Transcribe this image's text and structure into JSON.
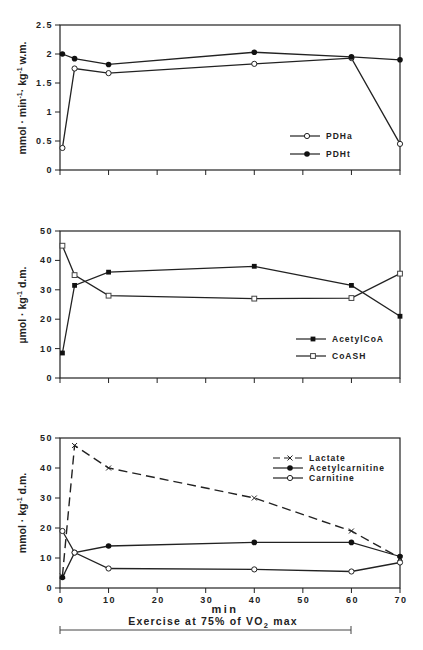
{
  "header": {
    "text": ""
  },
  "chart_data": [
    {
      "type": "line",
      "title": "",
      "xlabel": "",
      "ylabel": "mmol · min⁻¹ · kg⁻¹ w.m.",
      "ylim": [
        0,
        2.5
      ],
      "xlim": [
        0,
        70
      ],
      "yticks": [
        "0",
        "0.5",
        "1",
        "1.5",
        "2",
        "2.5"
      ],
      "legend_position": "lower right",
      "grid": false,
      "series": [
        {
          "name": "PDHa",
          "marker": "open-circle",
          "x": [
            0.5,
            3,
            10,
            40,
            60,
            70
          ],
          "values": [
            0.38,
            1.75,
            1.67,
            1.83,
            1.93,
            0.45
          ]
        },
        {
          "name": "PDHt",
          "marker": "filled-circle",
          "x": [
            0.5,
            3,
            10,
            40,
            60,
            70
          ],
          "values": [
            2.0,
            1.92,
            1.82,
            2.03,
            1.95,
            1.9
          ]
        }
      ]
    },
    {
      "type": "line",
      "title": "",
      "xlabel": "",
      "ylabel": "µmol · kg⁻¹ d.m.",
      "ylim": [
        0,
        50
      ],
      "xlim": [
        0,
        70
      ],
      "yticks": [
        "0",
        "10",
        "20",
        "30",
        "40",
        "50"
      ],
      "legend_position": "lower right",
      "grid": false,
      "series": [
        {
          "name": "AcetylCoA",
          "marker": "filled-square",
          "x": [
            0.5,
            3,
            10,
            40,
            60,
            70
          ],
          "values": [
            8.5,
            31.5,
            36,
            38,
            31.5,
            21
          ]
        },
        {
          "name": "CoASH",
          "marker": "open-square",
          "x": [
            0.5,
            3,
            10,
            40,
            60,
            70
          ],
          "values": [
            45,
            35,
            28,
            27,
            27.2,
            35.5
          ]
        }
      ]
    },
    {
      "type": "line",
      "title": "",
      "xlabel": "min",
      "ylabel": "mmol · kg⁻¹ d.m.",
      "ylim": [
        0,
        50
      ],
      "xlim": [
        0,
        70
      ],
      "xticks": [
        "0",
        "10",
        "20",
        "30",
        "40",
        "50",
        "60",
        "70"
      ],
      "yticks": [
        "0",
        "10",
        "20",
        "30",
        "40",
        "50"
      ],
      "legend_position": "upper right",
      "grid": false,
      "annotation": "Exercise at 75% of VO2 max (bar from 0 to 60 min)",
      "series": [
        {
          "name": "Lactate",
          "marker": "x",
          "line": "dashed",
          "x": [
            0.5,
            3,
            10,
            40,
            60,
            70
          ],
          "values": [
            4,
            47.5,
            40,
            30,
            19,
            10
          ]
        },
        {
          "name": "Acetylcarnitine",
          "marker": "filled-circle",
          "x": [
            0.5,
            3,
            10,
            40,
            60,
            70
          ],
          "values": [
            3.5,
            11.8,
            14,
            15.2,
            15.2,
            10.5
          ]
        },
        {
          "name": "Carnitine",
          "marker": "open-circle",
          "x": [
            0.5,
            3,
            10,
            40,
            60,
            70
          ],
          "values": [
            19,
            11.8,
            6.5,
            6.2,
            5.5,
            8.5
          ]
        }
      ]
    }
  ],
  "panels": {
    "p1": {
      "ylabel": "mmol · min",
      "ylabel_sup1": "-1",
      "ylabel_mid": "· kg",
      "ylabel_sup2": "-1",
      "ylabel_end": " w.m.",
      "yticks": [
        "0",
        "0.5",
        "1",
        "1.5",
        "2",
        "2.5"
      ],
      "legend": [
        "PDHa",
        "PDHt"
      ]
    },
    "p2": {
      "ylabel": "µmol · kg",
      "ylabel_sup": "-1",
      "ylabel_end": " d.m.",
      "yticks": [
        "0",
        "10",
        "20",
        "30",
        "40",
        "50"
      ],
      "legend": [
        "AcetylCoA",
        "CoASH"
      ]
    },
    "p3": {
      "ylabel": "mmol · kg",
      "ylabel_sup": "-1",
      "ylabel_end": " d.m.",
      "yticks": [
        "0",
        "10",
        "20",
        "30",
        "40",
        "50"
      ],
      "xticks": [
        "0",
        "10",
        "20",
        "30",
        "40",
        "50",
        "60",
        "70"
      ],
      "legend": [
        "Lactate",
        "Acetylcarnitine",
        "Carnitine"
      ],
      "xlabel": "min"
    },
    "exercise_band": {
      "label_pre": "Exercise at 75% of VO",
      "label_sub": "2",
      "label_post": " max"
    }
  }
}
